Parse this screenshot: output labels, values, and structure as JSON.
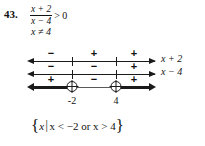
{
  "problem": {
    "number": "43.",
    "numerator": "x + 2",
    "denominator": "x − 4",
    "relation": "> 0",
    "restriction": "x ≠ 4"
  },
  "diagram": {
    "critical_points": [
      {
        "label": "-2",
        "value": -2,
        "type": "open"
      },
      {
        "label": "4",
        "value": 4,
        "type": "open"
      }
    ],
    "rows": [
      {
        "expression_label": "x + 2",
        "signs": [
          "−",
          "+",
          "+"
        ]
      },
      {
        "expression_label": "x − 4",
        "signs": [
          "−",
          "−",
          "+"
        ]
      },
      {
        "expression_label": "",
        "signs": [
          "+",
          "−",
          "+"
        ],
        "solution_intervals": [
          "left",
          "right"
        ]
      }
    ]
  },
  "solution_set": {
    "open_brace": "{",
    "variable": "x",
    "divider": "|",
    "condition": "x < −2 or x > 4",
    "close_brace": "}"
  },
  "colors": {
    "ink": "#1a1a1a",
    "paper": "#ffffff"
  }
}
